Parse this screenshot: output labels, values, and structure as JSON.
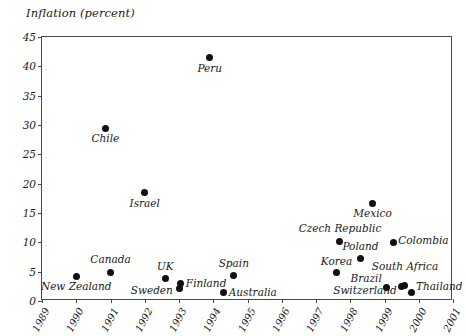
{
  "chart_data": {
    "type": "scatter",
    "title": "Inflation (percent)",
    "xlabel": "",
    "ylabel": "Inflation (percent)",
    "xlim": [
      1989,
      2001
    ],
    "ylim": [
      0,
      45
    ],
    "grid": false,
    "legend": "none",
    "x_ticks": [
      "1989",
      "1990",
      "1991",
      "1992",
      "1993",
      "1994",
      "1995",
      "1996",
      "1997",
      "1998",
      "1999",
      "2000",
      "2001"
    ],
    "y_ticks": [
      "0",
      "5",
      "10",
      "15",
      "20",
      "25",
      "30",
      "35",
      "40",
      "45"
    ],
    "points": [
      {
        "label": "New Zealand",
        "x": 1990.0,
        "y": 4.1,
        "lx": 1990.0,
        "ly": 2.2,
        "anchor": "middle"
      },
      {
        "label": "Chile",
        "x": 1990.85,
        "y": 29.4,
        "lx": 1990.85,
        "ly": 27.5,
        "anchor": "middle"
      },
      {
        "label": "Canada",
        "x": 1991.0,
        "y": 4.9,
        "lx": 1991.0,
        "ly": 6.8,
        "anchor": "middle"
      },
      {
        "label": "Israel",
        "x": 1992.0,
        "y": 18.5,
        "lx": 1992.0,
        "ly": 16.3,
        "anchor": "middle"
      },
      {
        "label": "Peru",
        "x": 1993.9,
        "y": 41.5,
        "lx": 1993.9,
        "ly": 39.3,
        "anchor": "middle"
      },
      {
        "label": "UK",
        "x": 1992.6,
        "y": 3.8,
        "lx": 1992.6,
        "ly": 5.6,
        "anchor": "middle"
      },
      {
        "label": "Sweden",
        "x": 1993.0,
        "y": 2.2,
        "lx": 1992.82,
        "ly": 1.6,
        "anchor": "end"
      },
      {
        "label": "Finland",
        "x": 1993.03,
        "y": 2.9,
        "lx": 1993.2,
        "ly": 2.7,
        "anchor": "start"
      },
      {
        "label": "Spain",
        "x": 1994.6,
        "y": 4.3,
        "lx": 1994.6,
        "ly": 6.2,
        "anchor": "middle"
      },
      {
        "label": "Australia",
        "x": 1994.3,
        "y": 1.4,
        "lx": 1994.45,
        "ly": 1.2,
        "anchor": "start"
      },
      {
        "label": "Mexico",
        "x": 1998.65,
        "y": 16.6,
        "lx": 1998.65,
        "ly": 14.6,
        "anchor": "middle"
      },
      {
        "label": "Czech Republic",
        "x": 1997.7,
        "y": 10.2,
        "lx": 1997.7,
        "ly": 12.1,
        "anchor": "middle"
      },
      {
        "label": "Poland",
        "x": 1998.3,
        "y": 7.2,
        "lx": 1998.3,
        "ly": 9.1,
        "anchor": "middle"
      },
      {
        "label": "Colombia",
        "x": 1999.25,
        "y": 10.0,
        "lx": 1999.4,
        "ly": 10.0,
        "anchor": "start"
      },
      {
        "label": "Korea",
        "x": 1997.6,
        "y": 4.8,
        "lx": 1997.6,
        "ly": 6.5,
        "anchor": "middle"
      },
      {
        "label": "Brazil",
        "x": 1999.05,
        "y": 2.3,
        "lx": 1998.92,
        "ly": 3.5,
        "anchor": "end"
      },
      {
        "label": "Switzerland",
        "x": 1999.5,
        "y": 2.4,
        "lx": 1999.36,
        "ly": 1.5,
        "anchor": "end"
      },
      {
        "label": "South Africa",
        "x": 1999.58,
        "y": 2.7,
        "lx": 1999.6,
        "ly": 5.6,
        "anchor": "middle"
      },
      {
        "label": "Thailand",
        "x": 1999.8,
        "y": 1.4,
        "lx": 1999.92,
        "ly": 2.2,
        "anchor": "start"
      }
    ]
  }
}
